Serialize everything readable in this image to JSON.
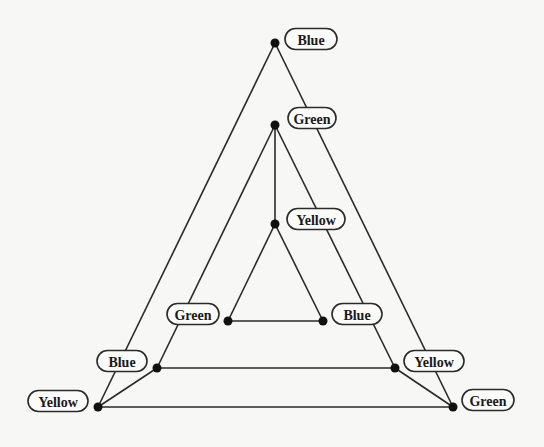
{
  "diagram": {
    "type": "graph-coloring",
    "nodes": [
      {
        "id": "n_top_outer",
        "label": "Blue",
        "x": 275,
        "y": 43,
        "lx": 311,
        "ly": 39,
        "lw": 52
      },
      {
        "id": "n_top_mid",
        "label": "Green",
        "x": 275,
        "y": 125,
        "lx": 312,
        "ly": 118,
        "lw": 48
      },
      {
        "id": "n_inner_top",
        "label": "Yellow",
        "x": 275,
        "y": 224,
        "lx": 316,
        "ly": 219,
        "lw": 58
      },
      {
        "id": "n_inner_left",
        "label": "Green",
        "x": 228,
        "y": 321,
        "lx": 193,
        "ly": 314,
        "lw": 52
      },
      {
        "id": "n_inner_right",
        "label": "Blue",
        "x": 323,
        "y": 321,
        "lx": 357,
        "ly": 314,
        "lw": 50
      },
      {
        "id": "n_mid_left",
        "label": "Blue",
        "x": 157,
        "y": 368,
        "lx": 122,
        "ly": 361,
        "lw": 50
      },
      {
        "id": "n_mid_right",
        "label": "Yellow",
        "x": 395,
        "y": 368,
        "lx": 434,
        "ly": 361,
        "lw": 60
      },
      {
        "id": "n_outer_left",
        "label": "Yellow",
        "x": 98,
        "y": 407,
        "lx": 58,
        "ly": 401,
        "lw": 60
      },
      {
        "id": "n_outer_right",
        "label": "Green",
        "x": 453,
        "y": 407,
        "lx": 488,
        "ly": 400,
        "lw": 52
      }
    ],
    "edges": [
      [
        "n_top_outer",
        "n_outer_left"
      ],
      [
        "n_top_outer",
        "n_outer_right"
      ],
      [
        "n_outer_left",
        "n_outer_right"
      ],
      [
        "n_top_mid",
        "n_mid_left"
      ],
      [
        "n_top_mid",
        "n_mid_right"
      ],
      [
        "n_mid_left",
        "n_mid_right"
      ],
      [
        "n_inner_top",
        "n_inner_left"
      ],
      [
        "n_inner_top",
        "n_inner_right"
      ],
      [
        "n_inner_left",
        "n_inner_right"
      ],
      [
        "n_top_mid",
        "n_inner_top"
      ],
      [
        "n_outer_left",
        "n_mid_left"
      ],
      [
        "n_outer_right",
        "n_mid_right"
      ]
    ]
  }
}
